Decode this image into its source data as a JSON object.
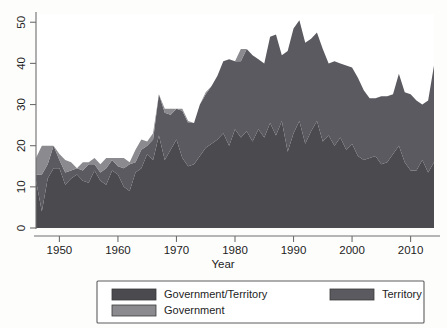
{
  "figure": {
    "background": "#fdfdfc",
    "plot": {
      "x": 36,
      "y": 14,
      "width": 398,
      "height": 214
    }
  },
  "axes": {
    "x": {
      "title": "Year",
      "tick_labels": [
        "1950",
        "1960",
        "1970",
        "1980",
        "1990",
        "2000",
        "2010"
      ],
      "tick_values": [
        1950,
        1960,
        1970,
        1980,
        1990,
        2000,
        2010
      ],
      "range": [
        1946,
        2014
      ]
    },
    "y": {
      "title": "",
      "tick_labels": [
        "0",
        "10",
        "20",
        "30",
        "40",
        "50"
      ],
      "tick_values": [
        0,
        10,
        20,
        30,
        40,
        50
      ],
      "range": [
        0,
        52
      ]
    }
  },
  "legend": {
    "position": "bottom",
    "entries": [
      {
        "label": "Government/Territory",
        "color": "#4a4a4f",
        "column": 0,
        "row": 0
      },
      {
        "label": "Territory",
        "color": "#5a5a60",
        "column": 1,
        "row": 0
      },
      {
        "label": "Government",
        "color": "#8a8a8f",
        "column": 0,
        "row": 1
      }
    ]
  },
  "colors": {
    "government_territory": "#4a4a4f",
    "territory": "#5a5a60",
    "government": "#8a8a8f",
    "axis": "#6e6e6e",
    "text": "#1d1d1d",
    "legend_border": "#5d5d5d"
  },
  "chart_data": {
    "type": "area",
    "stacked": true,
    "title": "",
    "xlabel": "Year",
    "ylabel": "",
    "xlim": [
      1946,
      2014
    ],
    "ylim": [
      0,
      52
    ],
    "grid": false,
    "legend_position": "bottom",
    "x": [
      1946,
      1947,
      1948,
      1949,
      1950,
      1951,
      1952,
      1953,
      1954,
      1955,
      1956,
      1957,
      1958,
      1959,
      1960,
      1961,
      1962,
      1963,
      1964,
      1965,
      1966,
      1967,
      1968,
      1969,
      1970,
      1971,
      1972,
      1973,
      1974,
      1975,
      1976,
      1977,
      1978,
      1979,
      1980,
      1981,
      1982,
      1983,
      1984,
      1985,
      1986,
      1987,
      1988,
      1989,
      1990,
      1991,
      1992,
      1993,
      1994,
      1995,
      1996,
      1997,
      1998,
      1999,
      2000,
      2001,
      2002,
      2003,
      2004,
      2005,
      2006,
      2007,
      2008,
      2009,
      2010,
      2011,
      2012,
      2013,
      2014
    ],
    "series": [
      {
        "name": "Government/Territory",
        "color": "#4a4a4f",
        "note": "bottom band of the stack",
        "values": [
          11.5,
          4.0,
          12.0,
          14.5,
          14.5,
          10.5,
          12.0,
          13.0,
          11.5,
          11.0,
          14.0,
          11.5,
          10.5,
          14.0,
          13.0,
          10.0,
          9.0,
          13.5,
          14.5,
          18.0,
          16.5,
          22.5,
          16.5,
          19.0,
          21.5,
          17.0,
          15.0,
          15.5,
          17.5,
          19.5,
          20.5,
          21.5,
          23.0,
          20.0,
          24.0,
          22.0,
          23.5,
          21.0,
          24.0,
          22.0,
          25.5,
          22.5,
          26.0,
          18.5,
          23.0,
          26.0,
          20.5,
          23.5,
          26.0,
          21.0,
          22.5,
          20.0,
          22.0,
          19.0,
          20.5,
          17.5,
          16.5,
          17.0,
          17.5,
          15.5,
          16.0,
          18.0,
          20.0,
          16.0,
          14.0,
          14.0,
          16.5,
          13.5,
          16.0
        ]
      },
      {
        "name": "Territory",
        "color": "#5a5a60",
        "note": "middle band of the stack",
        "values": [
          1.5,
          9.0,
          3.5,
          5.5,
          2.0,
          3.0,
          2.0,
          1.5,
          2.5,
          4.5,
          1.5,
          2.0,
          4.0,
          2.5,
          2.0,
          4.5,
          6.5,
          2.5,
          4.5,
          2.0,
          5.0,
          10.0,
          11.5,
          8.5,
          7.5,
          11.5,
          10.5,
          10.0,
          12.5,
          13.0,
          14.0,
          15.5,
          17.5,
          21.0,
          16.5,
          18.5,
          20.0,
          21.0,
          17.0,
          18.0,
          21.0,
          24.5,
          16.0,
          24.5,
          25.5,
          24.5,
          24.5,
          22.5,
          21.5,
          22.5,
          17.5,
          20.5,
          18.0,
          20.5,
          18.5,
          19.0,
          17.0,
          14.5,
          14.0,
          16.5,
          16.0,
          14.5,
          17.5,
          17.0,
          18.5,
          17.0,
          13.5,
          17.5,
          23.5
        ]
      },
      {
        "name": "Government",
        "color": "#8a8a8f",
        "note": "top band of the stack",
        "values": [
          4.0,
          7.0,
          4.5,
          0.0,
          1.5,
          3.0,
          2.0,
          0.0,
          2.0,
          0.5,
          1.5,
          2.0,
          2.5,
          0.5,
          2.0,
          2.5,
          0.5,
          3.0,
          2.5,
          1.0,
          1.5,
          0.0,
          1.0,
          1.5,
          0.0,
          0.5,
          0.5,
          0.0,
          0.0,
          0.5,
          0.0,
          0.0,
          0.0,
          0.0,
          0.0,
          3.0,
          0.0,
          0.0,
          0.0,
          0.0,
          0.0,
          0.0,
          0.0,
          0.0,
          0.0,
          0.0,
          0.0,
          0.0,
          0.0,
          0.0,
          0.0,
          0.0,
          0.0,
          0.0,
          0.0,
          0.0,
          0.0,
          0.0,
          0.0,
          0.0,
          0.0,
          0.0,
          0.0,
          0.0,
          0.0,
          0.0,
          0.0,
          0.0,
          0.0
        ]
      }
    ],
    "totals": [
      17.0,
      20.0,
      20.0,
      20.0,
      18.0,
      16.5,
      16.0,
      14.5,
      16.0,
      16.0,
      17.0,
      15.5,
      17.0,
      17.0,
      17.0,
      17.0,
      16.0,
      19.0,
      21.5,
      21.0,
      23.0,
      32.5,
      29.0,
      29.0,
      29.0,
      29.0,
      26.0,
      25.5,
      30.0,
      33.0,
      34.5,
      37.0,
      40.5,
      41.0,
      40.5,
      43.5,
      43.5,
      42.0,
      41.0,
      40.0,
      46.5,
      47.0,
      42.0,
      43.0,
      48.5,
      50.5,
      45.0,
      46.0,
      47.5,
      43.5,
      40.0,
      40.5,
      40.0,
      39.5,
      39.0,
      36.5,
      33.5,
      31.5,
      31.5,
      32.0,
      32.0,
      32.5,
      37.5,
      33.0,
      32.5,
      31.0,
      36.0,
      31.0,
      39.5
    ]
  }
}
